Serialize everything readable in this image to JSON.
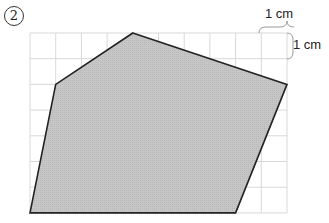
{
  "problem": {
    "number_label": "2"
  },
  "grid": {
    "origin_x": 30,
    "origin_y": 33,
    "cell": 25.7,
    "cols": 10,
    "rows": 7,
    "line_color": "#d8d8d8"
  },
  "polygon": {
    "vertices_grid": [
      [
        4,
        0
      ],
      [
        10,
        2
      ],
      [
        8,
        7
      ],
      [
        0,
        7
      ],
      [
        1,
        2
      ]
    ],
    "fill": "#c4c4c4",
    "stroke": "#222222"
  },
  "scale_labels": {
    "horizontal": "1 cm",
    "vertical": "1 cm"
  }
}
